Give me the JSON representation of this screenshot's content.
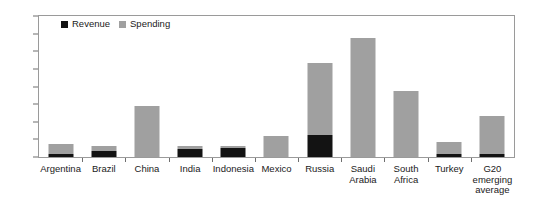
{
  "legend": {
    "position": "top-left-inside",
    "entries": [
      {
        "label": "Revenue",
        "color": "#131313"
      },
      {
        "label": "Spending",
        "color": "#a0a0a0"
      }
    ]
  },
  "axes": {
    "y": {
      "min": 0,
      "max": 16,
      "step": 2,
      "ticks": [
        "0",
        "2",
        "4",
        "6",
        "8",
        "10",
        "12",
        "14",
        "16"
      ]
    },
    "x": {
      "categories": [
        "Argentina",
        "Brazil",
        "China",
        "India",
        "Indonesia",
        "Mexico",
        "Russia",
        "Saudi\nArabia",
        "South\nAfrica",
        "Turkey",
        "G20\nemerging\naverage"
      ]
    }
  },
  "chart_data": {
    "type": "bar",
    "subtype": "stacked",
    "title": "",
    "subtitle": "",
    "xlabel": "",
    "ylabel": "",
    "ylim": [
      0,
      16
    ],
    "yticks": [
      0,
      2,
      4,
      6,
      8,
      10,
      12,
      14,
      16
    ],
    "grid": false,
    "legend_position": "top-left-inside",
    "categories": [
      "Argentina",
      "Brazil",
      "China",
      "India",
      "Indonesia",
      "Mexico",
      "Russia",
      "Saudi Arabia",
      "South Africa",
      "Turkey",
      "G20 emerging average"
    ],
    "series": [
      {
        "name": "Revenue",
        "color": "#131313",
        "values": [
          0.35,
          0.7,
          0.0,
          0.95,
          1.05,
          0.0,
          2.5,
          0.0,
          0.0,
          0.3,
          0.35
        ]
      },
      {
        "name": "Spending",
        "color": "#a0a0a0",
        "values": [
          1.15,
          0.55,
          5.75,
          0.3,
          0.2,
          2.4,
          8.2,
          13.5,
          7.5,
          1.4,
          4.25
        ]
      }
    ],
    "totals": [
      1.5,
      1.25,
      5.75,
      1.25,
      1.25,
      2.4,
      10.7,
      13.5,
      7.5,
      1.7,
      4.6
    ]
  },
  "colors": {
    "revenue": "#131313",
    "spending": "#a0a0a0",
    "axis": "#6f6f6f",
    "frame": "#9a9a9a",
    "text": "#1a1a1a",
    "background": "#ffffff"
  }
}
